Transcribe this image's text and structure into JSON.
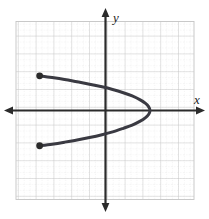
{
  "figure": {
    "name": "sideways-parabola-graph",
    "background_color": "#ffffff",
    "axis_color": "#2b2b2b",
    "curve_color": "#3a3a42",
    "point_color": "#2b2b2b",
    "minor_grid_color": "#d8d8d8",
    "major_grid_color": "#c0c0c0"
  },
  "axes": {
    "x_label": "x",
    "y_label": "y",
    "x_axis_name": "horizontal-axis",
    "y_axis_name": "vertical-axis",
    "arrow_style": "double-headed"
  },
  "chart_data": {
    "type": "line",
    "title": "",
    "xlabel": "x",
    "ylabel": "y",
    "grid": true,
    "legend": null,
    "xlim": [
      -5,
      5
    ],
    "ylim": [
      -5,
      5
    ],
    "major_tick_step": 1,
    "minor_per_major": 2,
    "curve_description": "Leftward-opening sideways parabola with vertex on the x-axis at x = 2.5, y = 0; branches end at marked endpoints",
    "equation": "x = 2.5 - 1.55 y^2",
    "vertex": [
      2.5,
      0
    ],
    "endpoints": [
      {
        "label": "upper-endpoint",
        "x": -3.7,
        "y": 1.95
      },
      {
        "label": "lower-endpoint",
        "x": -3.7,
        "y": -1.98
      }
    ],
    "series": [
      {
        "name": "parabola",
        "points": [
          [
            -3.7,
            1.95
          ],
          [
            -3.0,
            1.85
          ],
          [
            -2.3,
            1.74
          ],
          [
            -1.6,
            1.61
          ],
          [
            -0.9,
            1.48
          ],
          [
            -0.2,
            1.33
          ],
          [
            0.4,
            1.18
          ],
          [
            1.0,
            1.0
          ],
          [
            1.5,
            0.82
          ],
          [
            1.95,
            0.6
          ],
          [
            2.25,
            0.4
          ],
          [
            2.42,
            0.22
          ],
          [
            2.5,
            0.0
          ],
          [
            2.42,
            -0.22
          ],
          [
            2.25,
            -0.4
          ],
          [
            1.95,
            -0.6
          ],
          [
            1.5,
            -0.82
          ],
          [
            1.0,
            -1.0
          ],
          [
            0.4,
            -1.2
          ],
          [
            -0.2,
            -1.36
          ],
          [
            -0.9,
            -1.52
          ],
          [
            -1.6,
            -1.66
          ],
          [
            -2.3,
            -1.78
          ],
          [
            -3.0,
            -1.89
          ],
          [
            -3.7,
            -1.98
          ]
        ]
      }
    ]
  }
}
